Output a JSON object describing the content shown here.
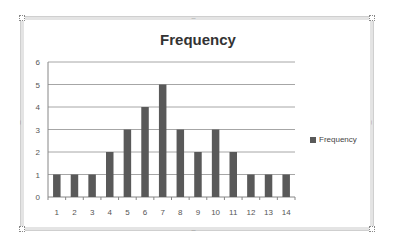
{
  "chart_data": {
    "type": "bar",
    "title": "Frequency",
    "xlabel": "",
    "ylabel": "",
    "categories": [
      "1",
      "2",
      "3",
      "4",
      "5",
      "6",
      "7",
      "8",
      "9",
      "10",
      "11",
      "12",
      "13",
      "14"
    ],
    "series": [
      {
        "name": "Frequency",
        "values": [
          1,
          1,
          1,
          2,
          3,
          4,
          5,
          3,
          2,
          3,
          2,
          1,
          1,
          1
        ],
        "color": "#595959"
      }
    ],
    "ylim": [
      0,
      6
    ],
    "yticks": [
      "0",
      "1",
      "2",
      "3",
      "4",
      "5",
      "6"
    ],
    "grid": true,
    "legend_position": "right"
  },
  "legend": {
    "label": "Frequency"
  },
  "colors": {
    "bar": "#595959",
    "grid": "#a6a6a6",
    "axis": "#868686",
    "title": "#333333",
    "tick_text": "#555555"
  }
}
